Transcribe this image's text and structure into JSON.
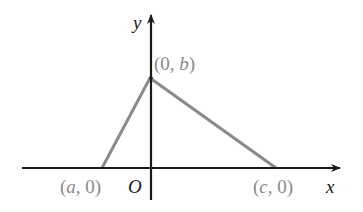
{
  "diagram": {
    "type": "coordinate-triangle",
    "axes": {
      "x_label": "x",
      "y_label": "y",
      "origin_label": "O"
    },
    "vertices": [
      {
        "name": "left",
        "label_open": "(",
        "label_var": "a",
        "label_close": ", 0)",
        "coords": "(a, 0)"
      },
      {
        "name": "top",
        "label_open": "(0, ",
        "label_var": "b",
        "label_close": ")",
        "coords": "(0, b)"
      },
      {
        "name": "right",
        "label_open": "(",
        "label_var": "c",
        "label_close": ", 0)",
        "coords": "(c, 0)"
      }
    ],
    "colors": {
      "axis": "#1a1a1a",
      "triangle": "#8a8a8a",
      "point_label": "#8a8a8a"
    }
  }
}
